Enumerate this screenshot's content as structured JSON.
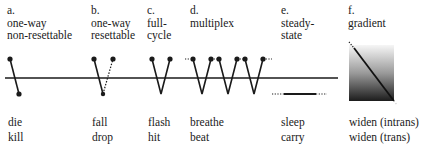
{
  "figure": {
    "panels": [
      {
        "letter": "a.",
        "title_l1": "one-way",
        "title_l2": "non-resettable",
        "example_1": "die",
        "example_2": "kill"
      },
      {
        "letter": "b.",
        "title_l1": "one-way",
        "title_l2": "resettable",
        "example_1": "fall",
        "example_2": "drop"
      },
      {
        "letter": "c.",
        "title_l1": "full-",
        "title_l2": "cycle",
        "example_1": "flash",
        "example_2": "hit"
      },
      {
        "letter": "d.",
        "title_l1": "multiplex",
        "title_l2": "",
        "example_1": "breathe",
        "example_2": "beat"
      },
      {
        "letter": "e.",
        "title_l1": "steady-",
        "title_l2": "state",
        "example_1": "sleep",
        "example_2": "carry"
      },
      {
        "letter": "f.",
        "title_l1": "gradient",
        "title_l2": "",
        "example_1": "widen (intrans)",
        "example_2": "widen (trans)"
      }
    ],
    "colors": {
      "ink": "#1a1a1a",
      "gradient_top": "#f4f4f4",
      "gradient_bottom": "#1c1c1c"
    }
  }
}
